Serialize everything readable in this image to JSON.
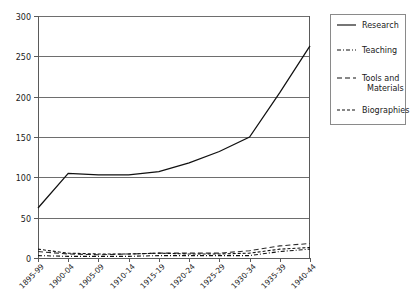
{
  "chart_data": {
    "type": "line",
    "title": "",
    "xlabel": "",
    "ylabel": "",
    "ylim": [
      0,
      300
    ],
    "yticks": [
      0,
      50,
      100,
      150,
      200,
      250,
      300
    ],
    "ytick_labels": [
      "0",
      "50",
      "100",
      "150",
      "200",
      "250",
      "300"
    ],
    "grid": true,
    "grid_axis": "y",
    "legend_position": "right",
    "categories": [
      "1895-99",
      "1900-04",
      "1905-09",
      "1910-14",
      "1915-19",
      "1920-24",
      "1925-29",
      "1930-34",
      "1935-39",
      "1940-44"
    ],
    "series": [
      {
        "name": "Research",
        "style": "solid",
        "values": [
          62,
          105,
          103,
          103,
          107,
          118,
          132,
          150,
          205,
          263
        ]
      },
      {
        "name": "Teaching",
        "style": "dash-dot",
        "values": [
          3,
          2,
          2,
          2,
          3,
          3,
          3,
          3,
          8,
          11
        ]
      },
      {
        "name": "Tools and Materials",
        "style": "long-dash",
        "values": [
          8,
          5,
          4,
          5,
          6,
          6,
          6,
          9,
          15,
          18
        ]
      },
      {
        "name": "Biographies",
        "style": "dashed",
        "values": [
          11,
          6,
          5,
          5,
          6,
          5,
          5,
          6,
          11,
          13
        ]
      }
    ]
  },
  "legend": {
    "entries": [
      {
        "label": "Research"
      },
      {
        "label": "Teaching"
      },
      {
        "label": "Tools and",
        "label2": "Materials"
      },
      {
        "label": "Biographies"
      }
    ]
  },
  "colors": {
    "series": "#111111",
    "grid": "#6e6e6e",
    "axis": "#5a5a5a",
    "legend_border": "#8a8a8a",
    "background": "#ffffff",
    "text": "#1a1a1a"
  }
}
